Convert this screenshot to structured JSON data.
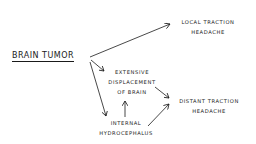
{
  "diagram": {
    "root": {
      "label": "BRAIN TUMOR"
    },
    "nodes": [
      {
        "id": "local",
        "lines": [
          "LOCAL TRACTION",
          "HEADACHE"
        ]
      },
      {
        "id": "displacement",
        "lines": [
          "EXTENSIVE",
          "DISPLACEMENT",
          "OF BRAIN"
        ]
      },
      {
        "id": "hydro",
        "lines": [
          "INTERNAL",
          "HYDROCEPHALUS"
        ]
      },
      {
        "id": "distant",
        "lines": [
          "DISTANT TRACTION",
          "HEADACHE"
        ]
      }
    ],
    "edges": [
      {
        "from": "BRAIN TUMOR",
        "to": "LOCAL TRACTION HEADACHE"
      },
      {
        "from": "BRAIN TUMOR",
        "to": "EXTENSIVE DISPLACEMENT OF BRAIN"
      },
      {
        "from": "BRAIN TUMOR",
        "to": "INTERNAL HYDROCEPHALUS"
      },
      {
        "from": "INTERNAL HYDROCEPHALUS",
        "to": "EXTENSIVE DISPLACEMENT OF BRAIN"
      },
      {
        "from": "EXTENSIVE DISPLACEMENT OF BRAIN",
        "to": "DISTANT TRACTION HEADACHE"
      },
      {
        "from": "INTERNAL HYDROCEPHALUS",
        "to": "DISTANT TRACTION HEADACHE"
      }
    ],
    "colors": {
      "ink": "#1a1a1a",
      "background": "#ffffff"
    }
  }
}
